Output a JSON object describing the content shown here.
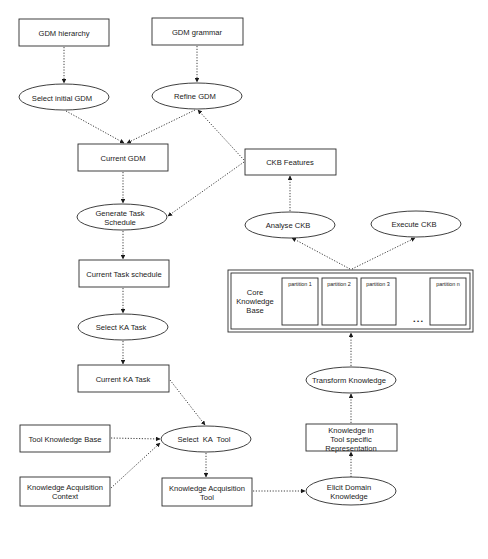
{
  "diagram": {
    "nodes": {
      "gdm_hierarchy": {
        "label": "GDM hierarchy",
        "shape": "rect"
      },
      "gdm_grammar": {
        "label": "GDM grammar",
        "shape": "rect"
      },
      "select_initial_gdm": {
        "label": "Select initial GDM",
        "shape": "ellipse"
      },
      "refine_gdm": {
        "label": "Refine GDM",
        "shape": "ellipse"
      },
      "current_gdm": {
        "label": "Current GDM",
        "shape": "rect"
      },
      "ckb_features": {
        "label": "CKB Features",
        "shape": "rect"
      },
      "generate_task_schedule": {
        "label_line1": "Generate Task",
        "label_line2": "Schedule",
        "shape": "ellipse"
      },
      "analyse_ckb": {
        "label": "Analyse CKB",
        "shape": "ellipse"
      },
      "execute_ckb": {
        "label": "Execute CKB",
        "shape": "ellipse"
      },
      "current_task_schedule": {
        "label": "Current Task schedule",
        "shape": "rect"
      },
      "core_knowledge_base": {
        "label_line1": "Core",
        "label_line2": "Knowledge",
        "label_line3": "Base",
        "shape": "double-rect",
        "partitions": [
          "partition 1",
          "partition 2",
          "partition 3",
          "partition n"
        ],
        "ellipsis": "• • •"
      },
      "select_ka_task": {
        "label": "Select KA Task",
        "shape": "ellipse"
      },
      "current_ka_task": {
        "label": "Current KA Task",
        "shape": "rect"
      },
      "transform_knowledge": {
        "label": "Transform Knowledge",
        "shape": "ellipse"
      },
      "tool_knowledge_base": {
        "label": "Tool Knowledge Base",
        "shape": "rect"
      },
      "select_ka_tool": {
        "label": "Select  KA  Tool",
        "shape": "ellipse"
      },
      "knowledge_tool_repr": {
        "label_line1": "Knowledge in",
        "label_line2": "Tool specific",
        "label_line3": "Representation",
        "shape": "rect"
      },
      "ka_context": {
        "label_line1": "Knowledge Acquisition",
        "label_line2": "Context",
        "shape": "rect"
      },
      "ka_tool": {
        "label_line1": "Knowledge Acquisition",
        "label_line2": "Tool",
        "shape": "rect"
      },
      "elicit_domain_knowledge": {
        "label_line1": "Elicit Domain",
        "label_line2": "Knowledge",
        "shape": "ellipse"
      }
    },
    "edges": [
      {
        "from": "GDM hierarchy",
        "to": "Select initial GDM"
      },
      {
        "from": "GDM grammar",
        "to": "Refine GDM"
      },
      {
        "from": "Select initial GDM",
        "to": "Current GDM"
      },
      {
        "from": "Refine GDM",
        "to": "Current GDM"
      },
      {
        "from": "CKB Features",
        "to": "Refine GDM"
      },
      {
        "from": "CKB Features",
        "to": "Generate Task Schedule"
      },
      {
        "from": "Current GDM",
        "to": "Generate Task Schedule"
      },
      {
        "from": "Generate Task Schedule",
        "to": "Current Task schedule"
      },
      {
        "from": "Current Task schedule",
        "to": "Select KA Task"
      },
      {
        "from": "Select KA Task",
        "to": "Current KA Task"
      },
      {
        "from": "Current KA Task",
        "to": "Select KA Tool"
      },
      {
        "from": "Tool Knowledge Base",
        "to": "Select KA Tool"
      },
      {
        "from": "Knowledge Acquisition Context",
        "to": "Select KA Tool"
      },
      {
        "from": "Select KA Tool",
        "to": "Knowledge Acquisition Tool"
      },
      {
        "from": "Knowledge Acquisition Tool",
        "to": "Elicit Domain Knowledge"
      },
      {
        "from": "Elicit Domain Knowledge",
        "to": "Knowledge in Tool specific Representation"
      },
      {
        "from": "Knowledge in Tool specific Representation",
        "to": "Transform Knowledge"
      },
      {
        "from": "Transform Knowledge",
        "to": "Core Knowledge Base"
      },
      {
        "from": "Core Knowledge Base",
        "to": "Analyse CKB"
      },
      {
        "from": "Core Knowledge Base",
        "to": "Execute CKB"
      },
      {
        "from": "Analyse CKB",
        "to": "CKB Features"
      }
    ]
  }
}
